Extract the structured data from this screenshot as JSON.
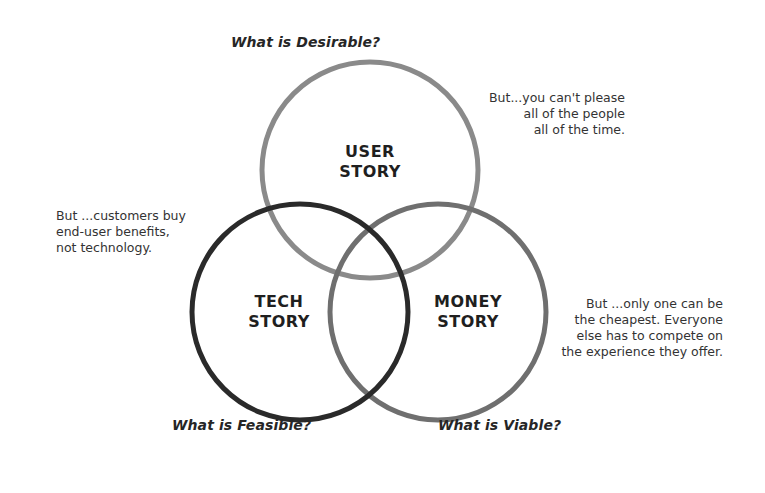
{
  "diagram": {
    "type": "venn",
    "circles": [
      {
        "id": "user",
        "label": "USER\nSTORY",
        "question": "What is Desirable?",
        "caveat": "But...you can't please\nall of the people\nall of the time.",
        "stroke": "#8a8a8a",
        "cx": 370,
        "cy": 170,
        "r": 108
      },
      {
        "id": "tech",
        "label": "TECH\nSTORY",
        "question": "What is Feasible?",
        "caveat": "But ...customers buy\nend-user benefits,\nnot technology.",
        "stroke": "#2a2a2a",
        "cx": 300,
        "cy": 312,
        "r": 108
      },
      {
        "id": "money",
        "label": "MONEY\nSTORY",
        "question": "What is Viable?",
        "caveat": "But ...only one can be\nthe cheapest. Everyone\nelse has to compete on\nthe experience they offer.",
        "stroke": "#6f6f6f",
        "cx": 438,
        "cy": 312,
        "r": 108
      }
    ],
    "stroke_width": 5
  }
}
